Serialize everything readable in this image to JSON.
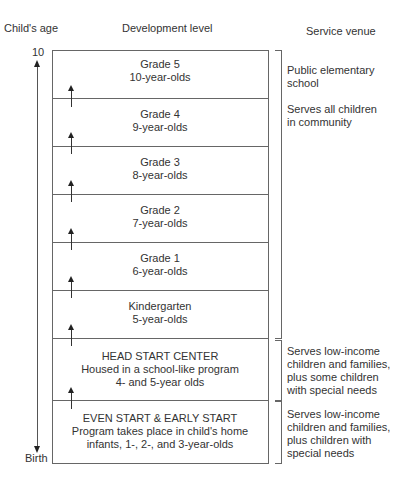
{
  "headers": {
    "age": "Child's age",
    "level": "Development level",
    "venue": "Service venue"
  },
  "axis": {
    "top_label": "10",
    "bottom_label": "Birth"
  },
  "levels": [
    {
      "line1": "Grade 5",
      "line2": "10-year-olds",
      "line3": ""
    },
    {
      "line1": "Grade 4",
      "line2": "9-year-olds",
      "line3": ""
    },
    {
      "line1": "Grade 3",
      "line2": "8-year-olds",
      "line3": ""
    },
    {
      "line1": "Grade 2",
      "line2": "7-year-olds",
      "line3": ""
    },
    {
      "line1": "Grade 1",
      "line2": "6-year-olds",
      "line3": ""
    },
    {
      "line1": "Kindergarten",
      "line2": "5-year-olds",
      "line3": ""
    },
    {
      "line1": "HEAD START CENTER",
      "line2": "Housed in a school-like program",
      "line3": "4- and 5-year olds"
    },
    {
      "line1": "EVEN START & EARLY START",
      "line2": "Program takes place in child's home",
      "line3": "infants, 1-, 2-, and 3-year-olds"
    }
  ],
  "venues": [
    {
      "title_line1": "Public elementary",
      "title_line2": "school",
      "desc_line1": "Serves all children",
      "desc_line2": "in community",
      "desc_line3": "",
      "desc_line4": ""
    },
    {
      "title_line1": "",
      "title_line2": "",
      "desc_line1": "Serves low-income",
      "desc_line2": "children and families,",
      "desc_line3": "plus some children",
      "desc_line4": "with special needs"
    },
    {
      "title_line1": "",
      "title_line2": "",
      "desc_line1": "Serves low-income",
      "desc_line2": "children and families,",
      "desc_line3": "plus children with",
      "desc_line4": "special needs"
    }
  ]
}
